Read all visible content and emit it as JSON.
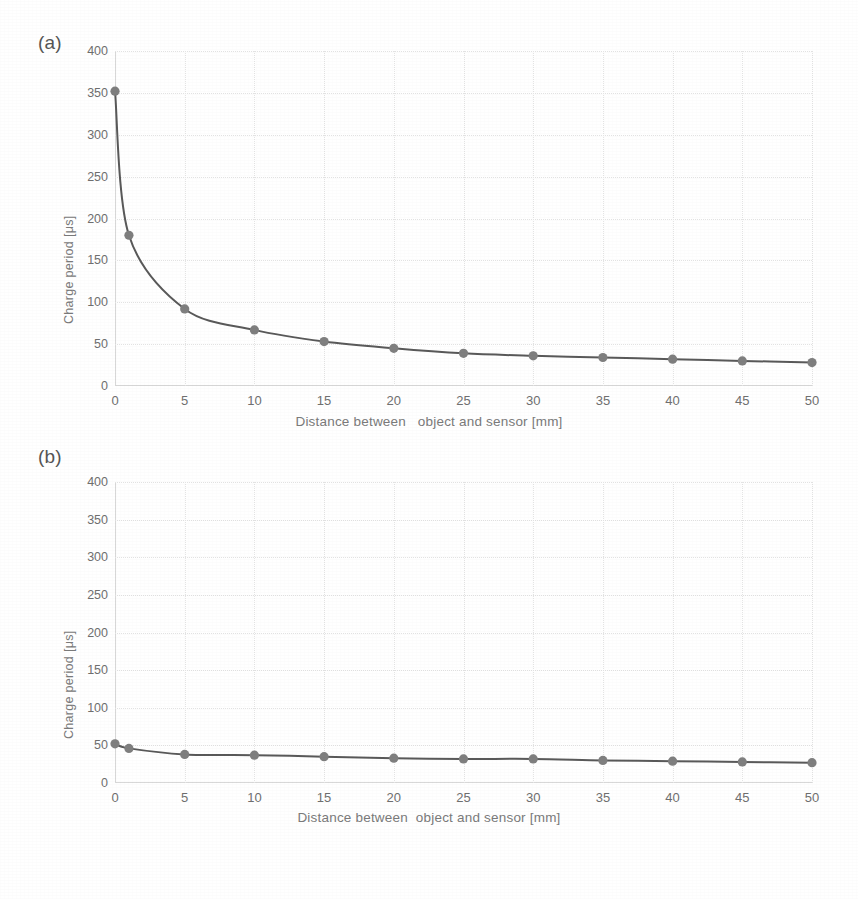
{
  "figure": {
    "panel_a_label": "(a)",
    "panel_b_label": "(b)"
  },
  "chart_data": [
    {
      "id": "a",
      "type": "line",
      "title": "",
      "panel_label": "(a)",
      "xlabel": "Distance between   object and sensor [mm]",
      "ylabel": "Charge period [μs]",
      "xlim": [
        0,
        50
      ],
      "ylim": [
        0,
        400
      ],
      "xticks": [
        0,
        5,
        10,
        15,
        20,
        25,
        30,
        35,
        40,
        45,
        50
      ],
      "yticks": [
        0,
        50,
        100,
        150,
        200,
        250,
        300,
        350,
        400
      ],
      "grid": true,
      "legend": "none",
      "marker": "circle",
      "line_color": "#595959",
      "marker_color": "#7f7f7f",
      "x": [
        0,
        1,
        5,
        10,
        15,
        20,
        25,
        30,
        35,
        40,
        45,
        50
      ],
      "values": [
        352,
        180,
        92,
        67,
        53,
        45,
        39,
        36,
        34,
        32,
        30,
        28
      ]
    },
    {
      "id": "b",
      "type": "line",
      "title": "",
      "panel_label": "(b)",
      "xlabel": "Distance between  object and sensor [mm]",
      "ylabel": "Charge period [μs]",
      "xlim": [
        0,
        50
      ],
      "ylim": [
        0,
        400
      ],
      "xticks": [
        0,
        5,
        10,
        15,
        20,
        25,
        30,
        35,
        40,
        45,
        50
      ],
      "yticks": [
        0,
        50,
        100,
        150,
        200,
        250,
        300,
        350,
        400
      ],
      "grid": true,
      "legend": "none",
      "marker": "circle",
      "line_color": "#595959",
      "marker_color": "#7f7f7f",
      "x": [
        0,
        1,
        5,
        10,
        15,
        20,
        25,
        30,
        35,
        40,
        45,
        50
      ],
      "values": [
        52,
        46,
        38,
        37,
        35,
        33,
        32,
        32,
        30,
        29,
        28,
        27
      ]
    }
  ],
  "colors": {
    "line": "#595959",
    "marker": "#7f7f7f",
    "grid": "#e2e2e2",
    "axis": "#d8d8d8",
    "text": "#6f6f6f",
    "background": "#ffffff"
  }
}
